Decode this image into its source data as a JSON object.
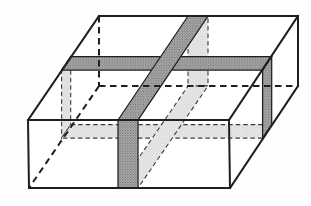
{
  "figure": {
    "title": "",
    "width": 311,
    "height": 206,
    "colors": {
      "background": "#fefefe",
      "face_fill": "#ffffff",
      "edge_stroke": "#1f1f1f",
      "hidden_edge_stroke": "#1f1f1f",
      "slab_visible_base": "#b0b0b0",
      "slab_visible_dot": "#585858",
      "slab_visible_outline": "#1f1f1f",
      "slab_hidden_base": "#eaeaea",
      "slab_hidden_dot": "#bdbdbd",
      "slab_hidden_outline": "#3a3a3a"
    }
  },
  "geometry": {
    "silhouette": [
      [
        28,
        120
      ],
      [
        99,
        16
      ],
      [
        298,
        16
      ],
      [
        298,
        86
      ],
      [
        230,
        188
      ],
      [
        29,
        188
      ]
    ],
    "hidden_slab_parts": [
      {
        "name": "slab-a-left-face-trace",
        "points": [
          [
            61.6,
            70.1
          ],
          [
            70.7,
            56.6
          ],
          [
            70.7,
            124.6
          ],
          [
            61.6,
            138.1
          ]
        ]
      },
      {
        "name": "slab-a-bottom-face-trace",
        "points": [
          [
            70.7,
            124.6
          ],
          [
            271.7,
            124.6
          ],
          [
            262.6,
            138.1
          ],
          [
            61.6,
            138.1
          ]
        ]
      },
      {
        "name": "slab-b-back-face-trace",
        "points": [
          [
            188,
            16
          ],
          [
            208,
            16
          ],
          [
            208,
            86
          ],
          [
            188,
            86
          ]
        ]
      },
      {
        "name": "slab-b-bottom-face-trace",
        "points": [
          [
            188,
            86
          ],
          [
            208,
            86
          ],
          [
            138,
            188
          ],
          [
            118,
            188
          ]
        ]
      }
    ],
    "visible_slab_parts": [
      {
        "name": "slab-a-top-face-band",
        "points": [
          [
            70.7,
            56.6
          ],
          [
            271.7,
            56.6
          ],
          [
            262.6,
            70.1
          ],
          [
            61.6,
            70.1
          ]
        ]
      },
      {
        "name": "slab-a-right-face-band",
        "points": [
          [
            262.6,
            70.1
          ],
          [
            271.7,
            56.6
          ],
          [
            271.7,
            124.6
          ],
          [
            262.6,
            138.1
          ]
        ]
      },
      {
        "name": "slab-b-top-face-band",
        "points": [
          [
            188,
            16
          ],
          [
            208,
            16
          ],
          [
            138,
            120
          ],
          [
            118,
            120
          ]
        ]
      },
      {
        "name": "slab-b-front-face-band",
        "points": [
          [
            118,
            120
          ],
          [
            138,
            120
          ],
          [
            138,
            188
          ],
          [
            118,
            188
          ]
        ]
      }
    ],
    "visible_edges": [
      {
        "name": "edge-top-back",
        "p1": [
          99,
          16
        ],
        "p2": [
          298,
          16
        ]
      },
      {
        "name": "edge-top-left-slant",
        "p1": [
          28,
          120
        ],
        "p2": [
          99,
          16
        ]
      },
      {
        "name": "edge-top-right-slant",
        "p1": [
          229,
          120
        ],
        "p2": [
          298,
          16
        ]
      },
      {
        "name": "edge-front-top",
        "p1": [
          28,
          120
        ],
        "p2": [
          229,
          120
        ]
      },
      {
        "name": "edge-front-left",
        "p1": [
          28,
          120
        ],
        "p2": [
          29,
          188
        ]
      },
      {
        "name": "edge-front-right",
        "p1": [
          229,
          120
        ],
        "p2": [
          230,
          188
        ]
      },
      {
        "name": "edge-front-bottom",
        "p1": [
          29,
          188
        ],
        "p2": [
          230,
          188
        ]
      },
      {
        "name": "edge-back-right",
        "p1": [
          298,
          16
        ],
        "p2": [
          298,
          86
        ]
      },
      {
        "name": "edge-bottom-right-slant",
        "p1": [
          230,
          188
        ],
        "p2": [
          298,
          86
        ]
      }
    ],
    "hidden_edges": [
      {
        "name": "edge-back-left-hidden",
        "p1": [
          99,
          16
        ],
        "p2": [
          99,
          86
        ]
      },
      {
        "name": "edge-bottom-back-hidden",
        "p1": [
          99,
          86
        ],
        "p2": [
          298,
          86
        ]
      },
      {
        "name": "edge-bottom-left-hidden",
        "p1": [
          99,
          86
        ],
        "p2": [
          29,
          188
        ]
      }
    ]
  }
}
